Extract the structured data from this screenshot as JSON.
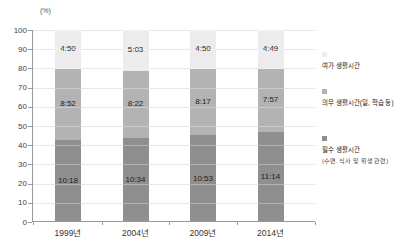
{
  "chart_data": {
    "type": "bar",
    "stacked": true,
    "title": "",
    "unit_label": "(%)",
    "xlabel": "",
    "ylabel": "(%)",
    "ylim": [
      0,
      100
    ],
    "yticks": [
      0,
      10,
      20,
      30,
      40,
      50,
      60,
      70,
      80,
      90,
      100
    ],
    "grid": true,
    "legend_position": "right",
    "categories": [
      "1999년",
      "2004년",
      "2009년",
      "2014년"
    ],
    "series": [
      {
        "name": "여가 생활시간",
        "values": [
          "4:50",
          "5:03",
          "4:50",
          "4:49"
        ],
        "pct": [
          20.2,
          21.1,
          20.2,
          20.1
        ],
        "color": "#ececec"
      },
      {
        "name": "의무 생활시간(일, 학습 등)",
        "values": [
          "8:52",
          "8:22",
          "8:17",
          "7:57"
        ],
        "pct": [
          36.9,
          34.9,
          34.5,
          33.1
        ],
        "color": "#b3b3b3"
      },
      {
        "name": "필수 생활시간(수면, 식사 및 위생 관련)",
        "values": [
          "10:18",
          "10:34",
          "10:53",
          "11:14"
        ],
        "pct": [
          42.9,
          44.0,
          45.3,
          46.8
        ],
        "color": "#8f8f8f"
      }
    ],
    "legend": [
      {
        "label": "여가 생활시간"
      },
      {
        "label": "의무 생활시간(일, 학습 등)"
      },
      {
        "label": "필수 생활시간",
        "sub": "(수면, 식사 및 위생 관련)"
      }
    ]
  }
}
